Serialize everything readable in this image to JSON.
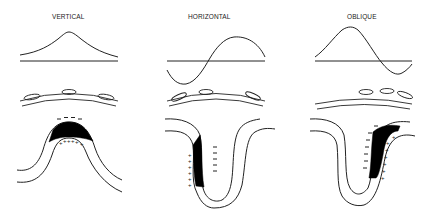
{
  "panels": [
    {
      "id": "vertical",
      "title": "VERTICAL",
      "waveform": "single positive peak (gaussian)",
      "dipole": "negative charge above crest, positive charge below",
      "negative_signs": "- - - -",
      "positive_signs": "+ + + + + +"
    },
    {
      "id": "horizontal",
      "title": "HORIZONTAL",
      "waveform": "biphasic: negative then positive",
      "dipole": "positive on left wall, negative on right side of left wall",
      "negative_signs": [
        "-",
        "-",
        "-",
        "-",
        "-"
      ],
      "positive_signs": [
        "+",
        "+",
        "+",
        "+",
        "+",
        "+"
      ]
    },
    {
      "id": "oblique",
      "title": "OBLIQUE",
      "waveform": "large positive peak then small negative trough",
      "dipole": "negative on left of right wall, positive on right",
      "negative_signs": [
        "-",
        "-",
        "-",
        "-",
        "-",
        "-",
        "-"
      ],
      "positive_signs": [
        "+",
        "+",
        "+",
        "+",
        "+",
        "+",
        "+"
      ]
    }
  ]
}
